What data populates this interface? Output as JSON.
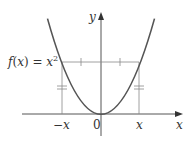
{
  "diagram": {
    "function_label": "f(x) = x²",
    "function_label_parts": {
      "f": "f",
      "open": "(",
      "x": "x",
      "close_eq": ") = ",
      "base": "x",
      "exp": "2"
    },
    "y_axis_label": "y",
    "x_axis_label": "x",
    "origin_label": "0",
    "neg_x_label": "−x",
    "pos_x_label": "x",
    "colors": {
      "curve": "#555555",
      "axes": "#555555",
      "guides": "#888888",
      "text": "#333333"
    }
  }
}
